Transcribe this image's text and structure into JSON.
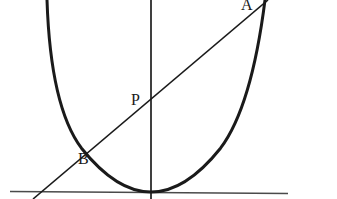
{
  "figure": {
    "kind": "geometry-diagram",
    "width": 337,
    "height": 199,
    "background_color": "#ffffff",
    "stroke_color": "#1a1a1a",
    "axis_color": "#4a4a4a"
  },
  "labels": {
    "point_a": "A",
    "point_p": "P",
    "point_b": "B"
  },
  "chart_data": {
    "type": "line",
    "title": "",
    "subtitle": "",
    "xlabel": "",
    "ylabel": "",
    "grid": false,
    "legend": null,
    "xlim": [
      0,
      337
    ],
    "ylim": [
      199,
      0
    ],
    "axes": {
      "x_axis": {
        "name": "horizontal-axis",
        "x1": 10,
        "y1": 191.5,
        "x2": 288,
        "y2": 193.5,
        "stroke_width": 1.3
      },
      "y_axis": {
        "name": "vertical-axis",
        "x1": 151,
        "y1": 0,
        "x2": 151,
        "y2": 199,
        "stroke_width": 1.8
      }
    },
    "curves": [
      {
        "name": "parabola",
        "type": "parabola",
        "vertex": [
          151,
          192
        ],
        "coefficient_a": 0.01775,
        "opens": "up",
        "stroke_width": 3,
        "path": "M 47 0 Q 50.5 107 81.5 148.2 Q 116.5 192 151 192 Q 185.5 192 220.5 148.2 Q 251.5 107 265 0",
        "endpoints": [
          [
            47,
            0
          ],
          [
            265,
            0
          ]
        ]
      },
      {
        "name": "chord-AB",
        "type": "segment",
        "from": [
          268,
          0
        ],
        "to": [
          33,
          199
        ],
        "stroke_width": 1.6
      }
    ],
    "points": [
      {
        "label": "A",
        "x": 262,
        "y": 4,
        "description": "chord meets right branch of parabola"
      },
      {
        "label": "P",
        "x": 151,
        "y": 103,
        "description": "chord meets vertical axis"
      },
      {
        "label": "B",
        "x": 97,
        "y": 155,
        "description": "chord meets left branch of parabola"
      }
    ],
    "annotations": [
      {
        "text": "A",
        "x": 243,
        "y": 3
      },
      {
        "text": "P",
        "x": 133,
        "y": 98
      },
      {
        "text": "B",
        "x": 80,
        "y": 157
      }
    ]
  }
}
